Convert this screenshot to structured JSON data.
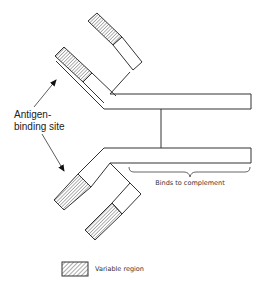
{
  "diagram": {
    "labels": {
      "antigen_line1": "Antigen-",
      "antigen_line2": "binding site",
      "complement": "Binds to complement"
    },
    "legend": {
      "label": "Variable region",
      "pattern": "hatched"
    },
    "colors": {
      "stroke": "#333333",
      "hatch": "#555555",
      "background": "#ffffff"
    }
  }
}
